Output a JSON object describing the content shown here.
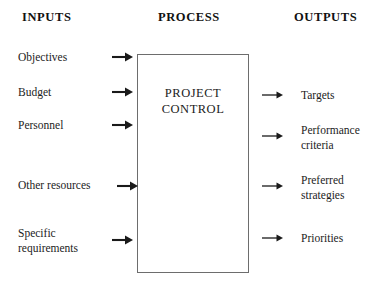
{
  "diagram": {
    "headers": {
      "inputs": "INPUTS",
      "process": "PROCESS",
      "outputs": "OUTPUTS"
    },
    "process_box": {
      "label": "PROJECT\nCONTROL",
      "border_color": "#6d6d6d",
      "fill_color": "#ffffff"
    },
    "inputs": [
      {
        "label": "Objectives",
        "arrow": "right-arrow-bold"
      },
      {
        "label": "Budget",
        "arrow": "right-arrow-bold"
      },
      {
        "label": "Personnel",
        "arrow": "right-arrow-bold"
      },
      {
        "label": "Other resources",
        "arrow": "right-arrow-bold"
      },
      {
        "label": "Specific\nrequirements",
        "arrow": "right-arrow-bold"
      }
    ],
    "outputs": [
      {
        "label": "Targets",
        "arrow": "right-arrow-thin"
      },
      {
        "label": "Performance\ncriteria",
        "arrow": "right-arrow-thin"
      },
      {
        "label": "Preferred\nstrategies",
        "arrow": "right-arrow-thin"
      },
      {
        "label": "Priorities",
        "arrow": "right-arrow-thin"
      }
    ],
    "colors": {
      "text": "#1c1c1c",
      "heading": "#111111",
      "arrow": "#1a1a1a",
      "background": "#ffffff"
    }
  }
}
